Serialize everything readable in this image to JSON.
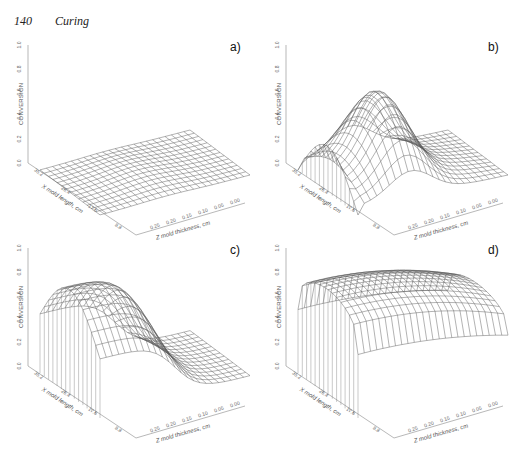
{
  "header": {
    "page_number": "140",
    "section_title": "Curing"
  },
  "chart_data": [
    {
      "id": "a",
      "label": "a)",
      "type": "surface3d",
      "zlabel": "CONVERSION",
      "xlabel": "X mold length, cm",
      "ylabel": "Z mold thickness, cm",
      "z_ticks": [
        "0.0",
        "0.2",
        "0.4",
        "0.6",
        "0.8",
        "1.0"
      ],
      "zlim": [
        0,
        1
      ],
      "x_ticks": [
        "35.2",
        "26.4",
        "17.6",
        "8.8"
      ],
      "y_ticks": [
        "0.25",
        "0.20",
        "0.15",
        "0.10",
        "0.05",
        "0.00"
      ],
      "description": "Nearly flat surface, conversion close to 0 everywhere (max ~0.05)",
      "peak": 0.05
    },
    {
      "id": "b",
      "label": "b)",
      "type": "surface3d",
      "zlabel": "CONVERSION",
      "xlabel": "X mold length, cm",
      "ylabel": "Z mold thickness, cm",
      "z_ticks": [
        "0.0",
        "0.2",
        "0.4",
        "0.6",
        "0.8",
        "1.0"
      ],
      "zlim": [
        0,
        1
      ],
      "x_ticks": [
        "35.2",
        "26.4",
        "17.6",
        "8.8"
      ],
      "y_ticks": [
        "0.25",
        "0.20",
        "0.15",
        "0.10",
        "0.05",
        "0.00"
      ],
      "description": "Peaked surface, maximum conversion ~0.6 near mid-thickness at inlet end, decaying to ~0 toward end of mold",
      "peak": 0.62
    },
    {
      "id": "c",
      "label": "c)",
      "type": "surface3d",
      "zlabel": "CONVERSION",
      "xlabel": "X mold length, cm",
      "ylabel": "Z mold thickness, cm",
      "z_ticks": [
        "0.0",
        "0.2",
        "0.4",
        "0.6",
        "0.8",
        "1.0"
      ],
      "zlim": [
        0,
        1
      ],
      "x_ticks": [
        "35.2",
        "26.4",
        "17.6",
        "8.8"
      ],
      "y_ticks": [
        "0.25",
        "0.20",
        "0.15",
        "0.10",
        "0.05",
        "0.00"
      ],
      "description": "Plateau of conversion ~0.9 over first half of mold, decreasing toward ~0 at far end",
      "peak": 0.92
    },
    {
      "id": "d",
      "label": "d)",
      "type": "surface3d",
      "zlabel": "CONVERSION",
      "xlabel": "X mold length, cm",
      "ylabel": "Z mold thickness, cm",
      "z_ticks": [
        "0.0",
        "0.2",
        "0.4",
        "0.6",
        "0.8",
        "1.0"
      ],
      "zlim": [
        0,
        1
      ],
      "x_ticks": [
        "35.2",
        "26.4",
        "17.6",
        "8.8"
      ],
      "y_ticks": [
        "0.25",
        "0.20",
        "0.15",
        "0.10",
        "0.05",
        "0.00"
      ],
      "description": "Conversion ~0.9 across nearly entire mold, slight decrease to ~0.6 at far end",
      "peak": 0.93
    }
  ]
}
